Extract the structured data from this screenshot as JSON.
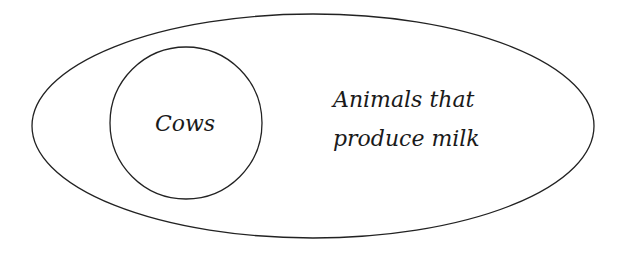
{
  "diagram": {
    "type": "euler",
    "outer_set": {
      "label_line1": "Animals that",
      "label_line2": "produce milk"
    },
    "inner_set": {
      "label": "Cows"
    },
    "stroke_color": "#222222",
    "background": "#ffffff"
  }
}
